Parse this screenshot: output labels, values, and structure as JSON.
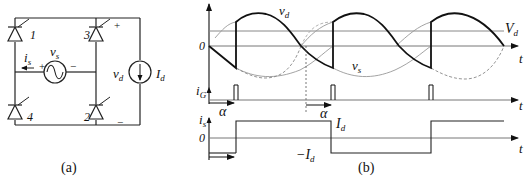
{
  "figure": {
    "caption_a": "(a)",
    "caption_b": "(b)"
  },
  "circuit": {
    "thyristors": [
      {
        "id": "1",
        "label": "1"
      },
      {
        "id": "3",
        "label": "3"
      },
      {
        "id": "4",
        "label": "4"
      },
      {
        "id": "2",
        "label": "2"
      }
    ],
    "source": {
      "label": "v",
      "sub": "s",
      "plus": "+",
      "minus": "−"
    },
    "source_current": {
      "label": "i",
      "sub": "s"
    },
    "output_voltage": {
      "label": "v",
      "sub": "d",
      "plus": "+",
      "minus": "−"
    },
    "load_current": {
      "label": "I",
      "sub": "d"
    }
  },
  "waveforms": {
    "voltage_panel": {
      "zero_label": "0",
      "vd_label": "v",
      "vd_sub": "d",
      "Vd_label": "V",
      "Vd_sub": "d",
      "vs_label": "v",
      "vs_sub": "s",
      "t_label": "t"
    },
    "gate_panel": {
      "ig_label": "i",
      "ig_sub": "G",
      "alpha_label_1": "α",
      "alpha_label_2": "α",
      "t_label": "t"
    },
    "current_panel": {
      "is_label": "i",
      "is_sub": "s",
      "zero_label": "0",
      "Id_label": "I",
      "Id_sub": "d",
      "neg_Id_label": "−I",
      "neg_Id_sub": "d",
      "t_label": "t"
    }
  }
}
